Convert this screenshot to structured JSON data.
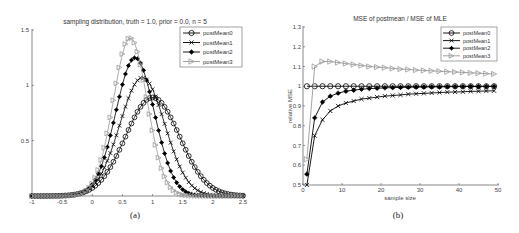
{
  "chart_data": [
    {
      "type": "line",
      "panel_label": "(a)",
      "title": "sampling distribution, truth = 1.0, prior = 0.0, n = 5",
      "xlabel": "",
      "ylabel": "",
      "xlim": [
        -1,
        2.5
      ],
      "ylim": [
        0,
        1.5
      ],
      "xticks": [
        "-1",
        "-0.5",
        "0",
        "0.5",
        "1",
        "1.5",
        "2",
        "2.5"
      ],
      "yticks": [
        "0.5",
        "1",
        "1.5"
      ],
      "grid": false,
      "legend_position": "upper right",
      "series": [
        {
          "name": "postMean0",
          "marker": "circle",
          "color": "#000000",
          "peak_x": 1.0,
          "peak_y": 0.89,
          "sd": 0.447
        },
        {
          "name": "postMean1",
          "marker": "x",
          "color": "#000000",
          "peak_x": 0.83,
          "peak_y": 1.07,
          "sd": 0.372
        },
        {
          "name": "postMean2",
          "marker": "star",
          "color": "#000000",
          "peak_x": 0.71,
          "peak_y": 1.25,
          "sd": 0.319
        },
        {
          "name": "postMean3",
          "marker": "triangle-right",
          "color": "#999999",
          "peak_x": 0.63,
          "peak_y": 1.43,
          "sd": 0.279
        }
      ]
    },
    {
      "type": "line",
      "panel_label": "(b)",
      "title": "MSE of postmean / MSE of MLE",
      "xlabel": "sample size",
      "ylabel": "relative MSE",
      "xlim": [
        0,
        50
      ],
      "ylim": [
        0.5,
        1.3
      ],
      "xticks": [
        "0",
        "10",
        "20",
        "30",
        "40",
        "50"
      ],
      "yticks": [
        "0.5",
        "0.6",
        "0.7",
        "0.8",
        "0.9",
        "1",
        "1.1",
        "1.2",
        "1.3"
      ],
      "grid": false,
      "legend_position": "upper right",
      "x": [
        1,
        3,
        5,
        7,
        9,
        11,
        13,
        15,
        17,
        19,
        21,
        23,
        25,
        27,
        29,
        31,
        33,
        35,
        37,
        39,
        41,
        43,
        45,
        47,
        49
      ],
      "series": [
        {
          "name": "postMean0",
          "marker": "circle",
          "color": "#000000",
          "values": [
            1.0,
            1.0,
            1.0,
            1.0,
            1.0,
            1.0,
            1.0,
            1.0,
            1.0,
            1.0,
            1.0,
            1.0,
            1.0,
            1.0,
            1.0,
            1.0,
            1.0,
            1.0,
            1.0,
            1.0,
            1.0,
            1.0,
            1.0,
            1.0,
            1.0
          ]
        },
        {
          "name": "postMean1",
          "marker": "x",
          "color": "#000000",
          "values": [
            0.5,
            0.75,
            0.83,
            0.875,
            0.9,
            0.915,
            0.925,
            0.935,
            0.94,
            0.945,
            0.95,
            0.953,
            0.956,
            0.96,
            0.962,
            0.964,
            0.966,
            0.968,
            0.97,
            0.971,
            0.972,
            0.974,
            0.975,
            0.976,
            0.977
          ]
        },
        {
          "name": "postMean2",
          "marker": "star",
          "color": "#000000",
          "values": [
            0.555,
            0.84,
            0.92,
            0.95,
            0.965,
            0.975,
            0.98,
            0.985,
            0.988,
            0.99,
            0.992,
            0.993,
            0.994,
            0.995,
            0.996,
            0.996,
            0.997,
            0.997,
            0.998,
            0.998,
            0.998,
            0.999,
            0.999,
            0.999,
            0.999
          ]
        },
        {
          "name": "postMean3",
          "marker": "triangle-right",
          "color": "#999999",
          "values": [
            0.63,
            1.1,
            1.125,
            1.125,
            1.12,
            1.115,
            1.11,
            1.105,
            1.1,
            1.097,
            1.094,
            1.09,
            1.087,
            1.085,
            1.082,
            1.08,
            1.078,
            1.076,
            1.074,
            1.072,
            1.07,
            1.068,
            1.066,
            1.064,
            1.062
          ]
        }
      ]
    }
  ],
  "figure": {
    "left": {
      "title": "sampling distribution, truth = 1.0, prior = 0.0, n = 5",
      "caption": "(a)",
      "legend": [
        "postMean0",
        "postMean1",
        "postMean2",
        "postMean3"
      ]
    },
    "right": {
      "title": "MSE of postmean / MSE of MLE",
      "caption": "(b)",
      "xlabel": "sample size",
      "ylabel": "relative MSE",
      "legend": [
        "postMean0",
        "postMean1",
        "postMean2",
        "postMean3"
      ]
    }
  }
}
